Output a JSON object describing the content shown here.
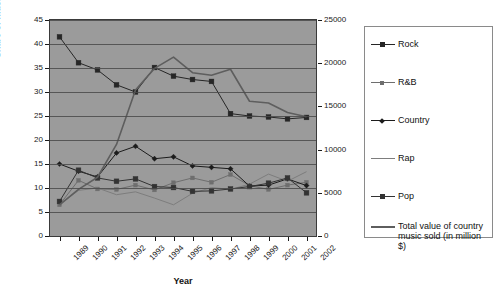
{
  "chart_data": {
    "type": "line",
    "title": "",
    "xlabel": "Year",
    "ylabel": "Share of music sold (%)",
    "ylabel_right": "",
    "categories": [
      "1989",
      "1990",
      "1991",
      "1992",
      "1993",
      "1994",
      "1995",
      "1996",
      "1997",
      "1998",
      "1999",
      "2000",
      "2001",
      "2002"
    ],
    "ylim": [
      0,
      45
    ],
    "yticks": [
      0,
      5,
      10,
      15,
      20,
      25,
      30,
      35,
      40,
      45
    ],
    "ylim_right": [
      0,
      25000
    ],
    "yticks_right": [
      0,
      5000,
      10000,
      15000,
      20000,
      25000
    ],
    "grid": true,
    "legend_position": "right",
    "series": [
      {
        "name": "Rock",
        "axis": "left",
        "marker": "square",
        "color": "#262626",
        "values": [
          41.5,
          36.1,
          34.6,
          31.5,
          30.0,
          35.1,
          33.3,
          32.6,
          32.2,
          25.5,
          25.0,
          24.8,
          24.4,
          24.7
        ]
      },
      {
        "name": "R&B",
        "axis": "left",
        "marker": "square-small",
        "color": "#6e6e6e",
        "values": [
          6.5,
          11.6,
          9.8,
          9.7,
          10.6,
          9.6,
          11.1,
          12.1,
          11.2,
          12.8,
          10.5,
          9.7,
          10.6,
          11.2
        ]
      },
      {
        "name": "Country",
        "axis": "left",
        "marker": "diamond",
        "color": "#1c1c1c",
        "values": [
          15.0,
          13.5,
          12.3,
          17.3,
          18.7,
          16.1,
          16.5,
          14.6,
          14.3,
          14.0,
          10.4,
          10.6,
          11.9,
          10.5
        ]
      },
      {
        "name": "Rap",
        "axis": "left",
        "marker": "none",
        "color": "#7d7d7d",
        "values": [
          6.5,
          9.5,
          10.0,
          8.6,
          9.2,
          7.9,
          6.5,
          8.9,
          10.1,
          9.7,
          10.8,
          12.9,
          11.4,
          13.4
        ]
      },
      {
        "name": "Pop",
        "axis": "left",
        "marker": "square",
        "color": "#333333",
        "values": [
          7.2,
          13.7,
          12.1,
          11.4,
          11.9,
          10.3,
          10.1,
          9.3,
          9.4,
          9.8,
          10.3,
          11.0,
          12.1,
          9.0
        ]
      },
      {
        "name": "Total value of country music sold (in million $)",
        "axis": "right",
        "marker": "none",
        "color": "#5e5e5e",
        "values": [
          3600,
          5400,
          6800,
          10600,
          16900,
          19400,
          20700,
          18900,
          18600,
          19300,
          15600,
          15400,
          14300,
          13800
        ]
      }
    ]
  },
  "legend": {
    "items": [
      {
        "label": "Rock"
      },
      {
        "label": "R&B"
      },
      {
        "label": "Country"
      },
      {
        "label": "Rap"
      },
      {
        "label": "Pop"
      },
      {
        "label": "Total value of country music sold (in million $)"
      }
    ]
  }
}
